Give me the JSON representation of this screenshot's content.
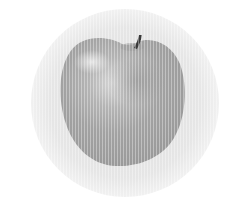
{
  "image": {
    "subject": "apple",
    "style": "grayscale halftone",
    "colors": {
      "background": "#ffffff",
      "disc": "#e6e6e6",
      "apple_light": "#d2d2d2",
      "apple_mid": "#a9a9a9",
      "apple_dark": "#8c8c8c",
      "stem": "#3a3a3a"
    }
  }
}
